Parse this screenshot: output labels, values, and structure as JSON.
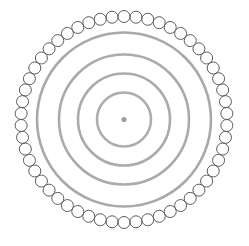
{
  "canvas": {
    "width": 249,
    "height": 246,
    "background_color": "#ffffff",
    "title": "Concentric circles with beaded outer ring"
  },
  "chart_data": {
    "type": "diagram",
    "title": "",
    "subtitle": "",
    "xlabel": "",
    "ylabel": "",
    "grid": false,
    "legend": null,
    "annotations": [],
    "center": {
      "x": 124,
      "y": 119.5
    },
    "elements": [
      {
        "name": "bead-ring",
        "shape": "ring-of-circles",
        "ring_radius": 103,
        "bead_count": 54,
        "bead_radius": 6,
        "stroke_color": "#5b5b5b",
        "stroke_width": 1,
        "fill": "none"
      },
      {
        "name": "gray-ring-1",
        "shape": "circle",
        "radius": 87,
        "stroke_color": "#a9a9a9",
        "stroke_width": 2.6,
        "fill": "none"
      },
      {
        "name": "gray-ring-2",
        "shape": "circle",
        "radius": 65,
        "stroke_color": "#ababab",
        "stroke_width": 2.6,
        "fill": "none"
      },
      {
        "name": "gray-ring-3",
        "shape": "circle",
        "radius": 46,
        "stroke_color": "#ababab",
        "stroke_width": 2.6,
        "fill": "none"
      },
      {
        "name": "gray-ring-4",
        "shape": "circle",
        "radius": 27,
        "stroke_color": "#adadad",
        "stroke_width": 2.6,
        "fill": "none"
      },
      {
        "name": "center-dot",
        "shape": "dot",
        "radius": 2.6,
        "fill_color": "#a0a0a0",
        "stroke_color": "none",
        "stroke_width": 0
      }
    ],
    "colors": {
      "bead_stroke": "#5b5b5b",
      "ring_stroke": "#a9a9a9",
      "center_dot": "#a0a0a0",
      "background": "#ffffff"
    }
  }
}
